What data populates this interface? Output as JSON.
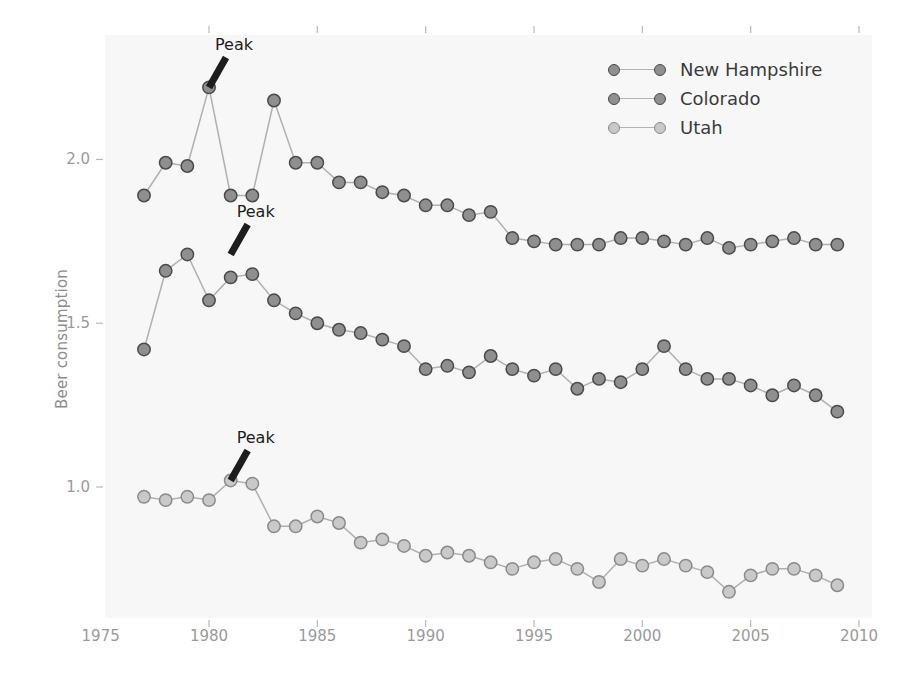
{
  "chart": {
    "ylabel": "Beer consumption",
    "xlabel": "",
    "title": "",
    "yticks": [
      "1.0",
      "1.5",
      "2.0"
    ],
    "xticks": [
      "1975",
      "1980",
      "1985",
      "1990",
      "1995",
      "2000",
      "2005",
      "2010"
    ],
    "annotation_text": "Peak"
  },
  "legend": {
    "position": "top-right",
    "items": [
      {
        "label": "New Hampshire",
        "color": "#8f8f8f"
      },
      {
        "label": "Colorado",
        "color": "#8f8f8f"
      },
      {
        "label": "Utah",
        "color": "#c9c9c9"
      }
    ]
  },
  "annotations": [
    {
      "text": "Peak",
      "series": "New Hampshire",
      "x": 1980,
      "y": 2.22
    },
    {
      "text": "Peak",
      "series": "Colorado",
      "x": 1981,
      "y": 1.71
    },
    {
      "text": "Peak",
      "series": "Utah",
      "x": 1981,
      "y": 1.02
    }
  ],
  "colors": {
    "panel_background": "#f7f7f7",
    "page_background": "#ffffff",
    "line": "#b0b0b0",
    "marker_dark_fill": "#8f8f8f",
    "marker_dark_edge": "#4a4a4a",
    "marker_light_fill": "#c9c9c9",
    "marker_light_edge": "#8a8a8a",
    "tick_text": "#9a9a9a",
    "axis_label_text": "#8d8d8d",
    "annotation": "#1d1d1d"
  },
  "chart_data": {
    "type": "line",
    "title": "",
    "xlabel": "",
    "ylabel": "Beer consumption",
    "xlim": [
      1975.2,
      2010.6
    ],
    "ylim": [
      0.6,
      2.38
    ],
    "grid": false,
    "legend_position": "top-right",
    "xticks": [
      1975,
      1980,
      1985,
      1990,
      1995,
      2000,
      2005,
      2010
    ],
    "yticks": [
      1.0,
      1.5,
      2.0
    ],
    "x": [
      1977,
      1978,
      1979,
      1980,
      1981,
      1982,
      1983,
      1984,
      1985,
      1986,
      1987,
      1988,
      1989,
      1990,
      1991,
      1992,
      1993,
      1994,
      1995,
      1996,
      1997,
      1998,
      1999,
      2000,
      2001,
      2002,
      2003,
      2004,
      2005,
      2006,
      2007,
      2008,
      2009
    ],
    "series": [
      {
        "name": "New Hampshire",
        "marker": "dark",
        "values": [
          1.89,
          1.99,
          1.98,
          2.22,
          1.89,
          1.89,
          2.18,
          1.99,
          1.99,
          1.93,
          1.93,
          1.9,
          1.89,
          1.86,
          1.86,
          1.83,
          1.84,
          1.76,
          1.75,
          1.74,
          1.74,
          1.74,
          1.76,
          1.76,
          1.75,
          1.74,
          1.76,
          1.73,
          1.74,
          1.75,
          1.76,
          1.74,
          1.74
        ]
      },
      {
        "name": "Colorado",
        "marker": "dark",
        "values": [
          1.42,
          1.66,
          1.71,
          1.57,
          1.64,
          1.65,
          1.57,
          1.53,
          1.5,
          1.48,
          1.47,
          1.45,
          1.43,
          1.36,
          1.37,
          1.35,
          1.4,
          1.36,
          1.34,
          1.36,
          1.3,
          1.33,
          1.32,
          1.36,
          1.43,
          1.36,
          1.33,
          1.33,
          1.31,
          1.28,
          1.31,
          1.28,
          1.23
        ]
      },
      {
        "name": "Utah",
        "marker": "light",
        "values": [
          0.97,
          0.96,
          0.97,
          0.96,
          1.02,
          1.01,
          0.88,
          0.88,
          0.91,
          0.89,
          0.83,
          0.84,
          0.82,
          0.79,
          0.8,
          0.79,
          0.77,
          0.75,
          0.77,
          0.78,
          0.75,
          0.71,
          0.78,
          0.76,
          0.78,
          0.76,
          0.74,
          0.68,
          0.73,
          0.75,
          0.75,
          0.73,
          0.7
        ]
      }
    ]
  }
}
